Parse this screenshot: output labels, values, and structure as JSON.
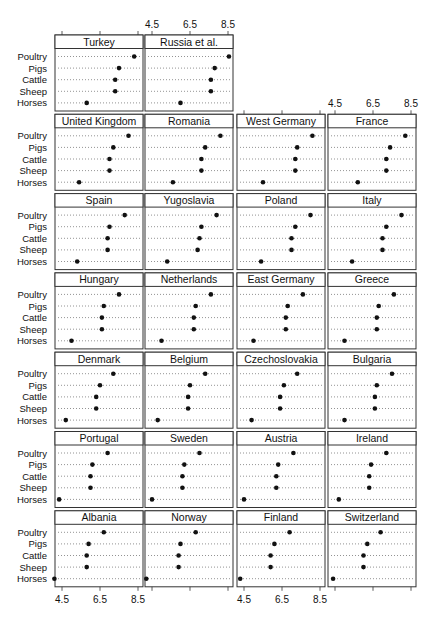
{
  "chart_data": {
    "type": "scatter",
    "subtype": "dot-plot-trellis",
    "title": "",
    "xlabel": "",
    "ylabel": "",
    "xlim": [
      4.1,
      8.7
    ],
    "x_ticks": [
      4.5,
      6.5,
      8.5
    ],
    "x_tick_labels": [
      "4.5",
      "6.5",
      "8.5"
    ],
    "grid": "dotted horizontal guide lines per category",
    "legend": null,
    "categories": [
      "Poultry",
      "Pigs",
      "Cattle",
      "Sheep",
      "Horses"
    ],
    "layout": {
      "columns": 4,
      "rows": 7
    },
    "panels": [
      {
        "name": "Turkey",
        "row": 0,
        "col": 0,
        "values": [
          8.3,
          7.5,
          7.3,
          7.3,
          5.8
        ]
      },
      {
        "name": "Russia et al.",
        "row": 0,
        "col": 1,
        "values": [
          8.55,
          7.8,
          7.6,
          7.6,
          6.0
        ]
      },
      {
        "name": "United Kingdom",
        "row": 1,
        "col": 0,
        "values": [
          8.0,
          7.2,
          7.0,
          7.0,
          5.4
        ]
      },
      {
        "name": "Romania",
        "row": 1,
        "col": 1,
        "values": [
          8.1,
          7.3,
          7.1,
          7.1,
          5.6
        ]
      },
      {
        "name": "West Germany",
        "row": 1,
        "col": 2,
        "values": [
          8.1,
          7.3,
          7.2,
          7.2,
          5.5
        ]
      },
      {
        "name": "France",
        "row": 1,
        "col": 3,
        "values": [
          8.2,
          7.4,
          7.2,
          7.2,
          5.7
        ]
      },
      {
        "name": "Spain",
        "row": 2,
        "col": 0,
        "values": [
          7.8,
          7.0,
          6.9,
          6.9,
          5.3
        ]
      },
      {
        "name": "Yugoslavia",
        "row": 2,
        "col": 1,
        "values": [
          7.9,
          7.1,
          7.0,
          6.9,
          5.3
        ]
      },
      {
        "name": "Poland",
        "row": 2,
        "col": 2,
        "values": [
          8.0,
          7.2,
          7.0,
          7.0,
          5.4
        ]
      },
      {
        "name": "Italy",
        "row": 2,
        "col": 3,
        "values": [
          8.0,
          7.2,
          7.0,
          7.0,
          5.4
        ]
      },
      {
        "name": "Hungary",
        "row": 3,
        "col": 0,
        "values": [
          7.5,
          6.7,
          6.6,
          6.6,
          5.0
        ]
      },
      {
        "name": "Netherlands",
        "row": 3,
        "col": 1,
        "values": [
          7.6,
          6.8,
          6.7,
          6.7,
          5.0
        ]
      },
      {
        "name": "East Germany",
        "row": 3,
        "col": 2,
        "values": [
          7.6,
          6.8,
          6.7,
          6.7,
          5.0
        ]
      },
      {
        "name": "Greece",
        "row": 3,
        "col": 3,
        "values": [
          7.6,
          6.8,
          6.7,
          6.7,
          5.0
        ]
      },
      {
        "name": "Denmark",
        "row": 4,
        "col": 0,
        "values": [
          7.2,
          6.5,
          6.3,
          6.3,
          4.7
        ]
      },
      {
        "name": "Belgium",
        "row": 4,
        "col": 1,
        "values": [
          7.3,
          6.5,
          6.4,
          6.4,
          4.8
        ]
      },
      {
        "name": "Czechoslovakia",
        "row": 4,
        "col": 2,
        "values": [
          7.3,
          6.6,
          6.4,
          6.4,
          4.9
        ]
      },
      {
        "name": "Bulgaria",
        "row": 4,
        "col": 3,
        "values": [
          7.5,
          6.7,
          6.6,
          6.6,
          5.0
        ]
      },
      {
        "name": "Portugal",
        "row": 5,
        "col": 0,
        "values": [
          6.9,
          6.1,
          6.0,
          6.0,
          4.35
        ]
      },
      {
        "name": "Sweden",
        "row": 5,
        "col": 1,
        "values": [
          7.0,
          6.2,
          6.1,
          6.1,
          4.5
        ]
      },
      {
        "name": "Austria",
        "row": 5,
        "col": 2,
        "values": [
          7.1,
          6.3,
          6.2,
          6.2,
          4.5
        ]
      },
      {
        "name": "Ireland",
        "row": 5,
        "col": 3,
        "values": [
          7.2,
          6.4,
          6.3,
          6.3,
          4.7
        ]
      },
      {
        "name": "Albania",
        "row": 6,
        "col": 0,
        "values": [
          6.7,
          5.9,
          5.8,
          5.8,
          4.1
        ]
      },
      {
        "name": "Norway",
        "row": 6,
        "col": 1,
        "values": [
          6.8,
          6.0,
          5.9,
          5.9,
          4.2
        ]
      },
      {
        "name": "Finland",
        "row": 6,
        "col": 2,
        "values": [
          6.9,
          6.1,
          5.9,
          5.9,
          4.3
        ]
      },
      {
        "name": "Switzerland",
        "row": 6,
        "col": 3,
        "values": [
          6.9,
          6.2,
          6.0,
          6.0,
          4.4
        ]
      }
    ],
    "top_axis_labels_above": [
      "Russia et al.",
      "France"
    ],
    "bottom_axis_labels_below": [
      "Albania",
      "Finland"
    ]
  },
  "colors": {
    "frame": "#333333",
    "dot": "#111111",
    "guide": "#777777",
    "background": "#ffffff"
  }
}
